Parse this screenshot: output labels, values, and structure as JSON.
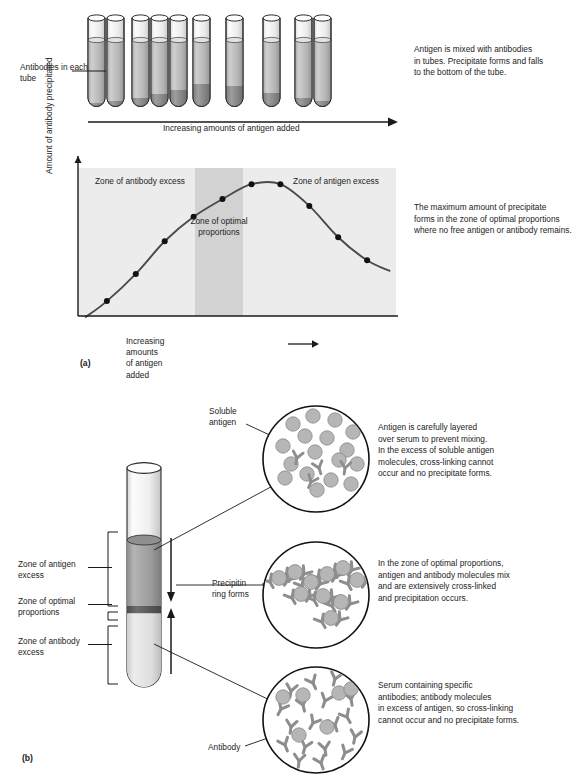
{
  "panel_a": {
    "key": "(a)",
    "left_label": "Antibodies in\neach tube",
    "right_caption": "Antigen is mixed with antibodies\nin tubes. Precipitate forms and falls\nto the bottom of the tube.",
    "rack_axis_label": "Increasing amounts of antigen added",
    "tube_count": 10,
    "precipitate_levels": [
      3,
      5,
      8,
      12,
      16,
      22,
      20,
      13,
      8,
      5
    ]
  },
  "chart_data": {
    "type": "line",
    "title": "",
    "xlabel": "Increasing amounts of antigen added",
    "ylabel": "Amount of antibody precipitated",
    "x": [
      1,
      2,
      3,
      4,
      5,
      6,
      7,
      8,
      9,
      10
    ],
    "values": [
      8,
      28,
      52,
      70,
      83,
      94,
      94,
      78,
      55,
      38
    ],
    "xlim": [
      0,
      11
    ],
    "ylim": [
      0,
      100
    ],
    "grid": false,
    "legend": "none",
    "marker": "filled-circle",
    "annotations": [
      {
        "name": "zone-antibody-excess",
        "text": "Zone of\nantibody excess"
      },
      {
        "name": "zone-optimal-proportions",
        "text": "Zone of\noptimal\nproportions"
      },
      {
        "name": "zone-antigen-excess",
        "text": "Zone of\nantigen excess"
      }
    ],
    "side_note": "The maximum amount of precipitate\nforms in the zone of optimal proportions\nwhere no free antigen or antibody remains.",
    "band_color": "#d2d2d2",
    "plot_bg": "#ececec",
    "curve_color": "#4a4a4a"
  },
  "panel_b": {
    "key": "(b)",
    "tube_labels": [
      {
        "name": "zone-antigen-excess",
        "text": "Zone of antigen\nexcess"
      },
      {
        "name": "zone-optimal-proportions",
        "text": "Zone of optimal\nproportions"
      },
      {
        "name": "zone-antibody-excess",
        "text": "Zone of antibody\nexcess"
      }
    ],
    "callouts": [
      {
        "name": "soluble-antigen",
        "text": "Soluble\nantigen"
      },
      {
        "name": "precipitin-ring",
        "text": "Precipitin\nring forms"
      },
      {
        "name": "antibody",
        "text": "Antibody"
      }
    ],
    "circles": [
      {
        "name": "top-circle-antigen-excess",
        "caption": "Antigen is carefully layered\nover serum to prevent mixing.\nIn the excess of soluble antigen\nmolecules, cross-linking cannot\noccur and no precipitate forms.",
        "antigen_count": 17,
        "antibody_count": 4
      },
      {
        "name": "middle-circle-optimal",
        "caption": "In the zone of optimal proportions,\nantigen and antibody molecules mix\nand are extensively cross-linked\nand precipitation occurs.",
        "antigen_count": 10,
        "antibody_count": 9
      },
      {
        "name": "bottom-circle-antibody-excess",
        "caption": "Serum containing specific\nantibodies; antibody molecules\nin excess of antigen, so cross-linking\ncannot occur and no precipitate forms.",
        "antigen_count": 6,
        "antibody_count": 18
      }
    ],
    "tube_layers": {
      "antigen_color": "#9a9a9a",
      "precipitin_color": "#5c5c5c",
      "serum_color": "#d5d5d5"
    }
  },
  "palette": {
    "antigen_fill": "#b6b6b6",
    "antibody_stroke": "#8e8e8e",
    "outline": "#1a1a1a",
    "glass": "#f4f4f4"
  }
}
